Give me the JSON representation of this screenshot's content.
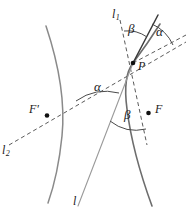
{
  "figure": {
    "background_color": "#ffffff",
    "curve_color": "#8a8a8a",
    "ray_color": "#3a3a3a",
    "dash_color": "#5a5a5a",
    "point_color": "#111111"
  },
  "labels": {
    "tangent_line": "l",
    "tangent_line_sub": "1",
    "focal_axis_line": "l",
    "focal_axis_line_sub": "2",
    "asymptote_line": "l",
    "point_p": "P",
    "focus_near": "F",
    "focus_far": "F'",
    "angle_beta_top": "β",
    "angle_alpha_top": "α",
    "angle_alpha_center": "α",
    "angle_beta_bottom": "β"
  },
  "geometry": {
    "point_p": [
      133,
      63
    ],
    "focus_near": [
      148.5,
      113
    ],
    "focus_far": [
      47,
      115.5
    ],
    "left_branch": "M 46,26 C 56,56 66,96 62,136 C 59,166 54,186 48,203",
    "right_branch": "M 150,205 C 140,175 130,140 126,108 C 123,86 126,72 133,63",
    "right_branch_upper": "M 133,63 C 140,56 150,46 162,30",
    "thin_ray": "M 133,63 L 78,205",
    "dashed_focal_axis": "M 9,145 L 186,42",
    "dashed_l1": "M 120,20 L 144,131",
    "dashed_alpha_edge": "M 133,63 L 184,35",
    "solid_tangent": "M 133,63 L 158,16",
    "arc_beta_top": "M 125.5,33.5 A 31,31 0 0 1 148,39",
    "arc_alpha_top": "M 152,25 A 38,38 0 0 1 171,44",
    "arc_alpha_center": "M 78,99 A 46,46 0 0 1 117,92",
    "arc_beta_bottom": "M 113,119 A 40,40 0 0 0 148,128"
  },
  "label_positions": {
    "l1": [
      113,
      10
    ],
    "l2": [
      3,
      146
    ],
    "l": [
      75,
      196
    ],
    "P": [
      137,
      62
    ],
    "F": [
      154,
      104
    ],
    "F_prime": [
      30,
      104
    ],
    "beta_top": [
      129,
      24
    ],
    "alpha_top": [
      156,
      27
    ],
    "alpha_center": [
      95,
      81
    ],
    "beta_bottom": [
      125,
      110
    ]
  }
}
